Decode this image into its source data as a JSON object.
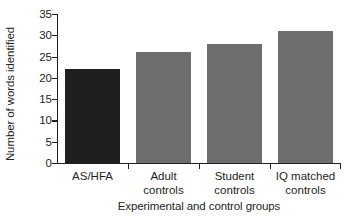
{
  "chart_data": {
    "type": "bar",
    "title": "",
    "xlabel": "Experimental and control groups",
    "ylabel": "Number of words identified",
    "categories": [
      "AS/HFA",
      "Adult controls",
      "Student controls",
      "IQ matched controls"
    ],
    "category_lines": [
      [
        "AS/HFA"
      ],
      [
        "Adult",
        "controls"
      ],
      [
        "Student",
        "controls"
      ],
      [
        "IQ matched",
        "controls"
      ]
    ],
    "values": [
      22,
      26,
      28,
      31
    ],
    "bar_colors": [
      "#1f1f1f",
      "#6e6e6e",
      "#6e6e6e",
      "#6e6e6e"
    ],
    "ylim": [
      0,
      35
    ],
    "ytick_step": 5,
    "yticks": [
      0,
      5,
      10,
      15,
      20,
      25,
      30,
      35
    ],
    "ytick_labels": [
      "0",
      "5",
      "10",
      "15",
      "20",
      "25",
      "30",
      "35"
    ],
    "grid": false,
    "legend": null,
    "legend_position": "none",
    "axis_color": "#231f20",
    "background": "#ffffff"
  }
}
